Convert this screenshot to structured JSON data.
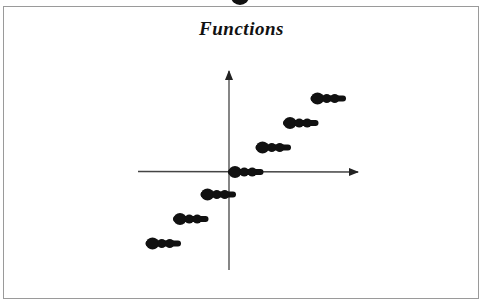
{
  "chart_data": {
    "type": "line",
    "subtype": "step",
    "title": "Functions",
    "xlabel": "",
    "ylabel": "",
    "series": [
      {
        "name": "floor(x)",
        "segments": [
          {
            "x_start": -3,
            "x_end": -2,
            "y": -3
          },
          {
            "x_start": -2,
            "x_end": -1,
            "y": -2
          },
          {
            "x_start": -1,
            "x_end": 0,
            "y": -1
          },
          {
            "x_start": 0,
            "x_end": 1,
            "y": 0
          },
          {
            "x_start": 1,
            "x_end": 2,
            "y": 1
          },
          {
            "x_start": 2,
            "x_end": 3,
            "y": 2
          },
          {
            "x_start": 3,
            "x_end": 4,
            "y": 3
          }
        ]
      }
    ],
    "axes": {
      "x_arrow": true,
      "y_arrow": true,
      "tick_labels": false
    },
    "grid": false,
    "legend": "none"
  },
  "colors": {
    "ink": "#111111",
    "axis": "#444444",
    "frame": "#9a9a9a",
    "background": "#ffffff"
  }
}
